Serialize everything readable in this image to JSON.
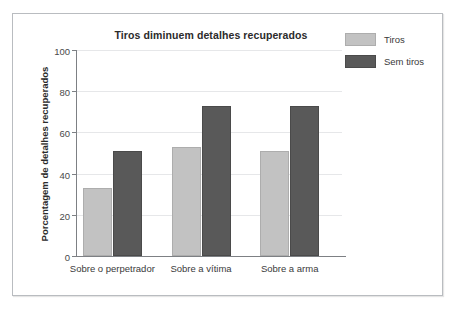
{
  "chart_data": {
    "type": "bar",
    "title": "Tiros diminuem detalhes recuperados",
    "xlabel": "",
    "ylabel": "Porcentagem de detalhes recuperados",
    "categories": [
      "Sobre o perpetrador",
      "Sobre a vítima",
      "Sobre a arma"
    ],
    "series": [
      {
        "name": "Tiros",
        "values": [
          33,
          53,
          51
        ],
        "color": "#c2c2c2"
      },
      {
        "name": "Sem tiros",
        "values": [
          51,
          73,
          73
        ],
        "color": "#595959"
      }
    ],
    "ylim": [
      0,
      100
    ],
    "yticks": [
      0,
      20,
      40,
      60,
      80,
      100
    ],
    "ytick_labels": [
      "0",
      "20",
      "40",
      "60",
      "80",
      "100"
    ],
    "grid": true,
    "legend_position": "top-right"
  },
  "figure": {
    "border_color": "#b9bcc0",
    "background": "#ffffff",
    "axis_color": "#7d8084",
    "grid_color": "#e6e7e9"
  }
}
